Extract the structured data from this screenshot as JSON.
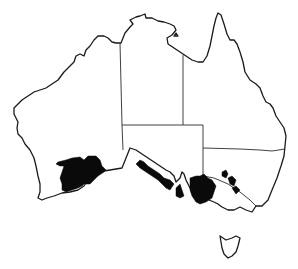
{
  "map": {
    "title": "Distribution map of Australia",
    "region": "Australia",
    "colors": {
      "background": "#ffffff",
      "outline": "#1a1a1a",
      "distribution_fill": "#0a0a0a"
    },
    "states": [
      {
        "id": "WA",
        "name": "Western Australia"
      },
      {
        "id": "NT",
        "name": "Northern Territory"
      },
      {
        "id": "QLD",
        "name": "Queensland"
      },
      {
        "id": "SA",
        "name": "South Australia"
      },
      {
        "id": "NSW",
        "name": "New South Wales"
      },
      {
        "id": "VIC",
        "name": "Victoria"
      },
      {
        "id": "TAS",
        "name": "Tasmania"
      }
    ],
    "distribution_areas": [
      {
        "id": "sw-wa",
        "description": "South-west Western Australia (wheatbelt / Great Southern)"
      },
      {
        "id": "sa-coast",
        "description": "Southern South Australia coast / Eyre Peninsula"
      },
      {
        "id": "yorke-peninsula",
        "description": "Yorke Peninsula, SA"
      },
      {
        "id": "murray-mallee",
        "description": "Murray Mallee / NW Victoria / SW NSW"
      },
      {
        "id": "central-nsw",
        "description": "Scattered patches, central NSW"
      }
    ]
  }
}
